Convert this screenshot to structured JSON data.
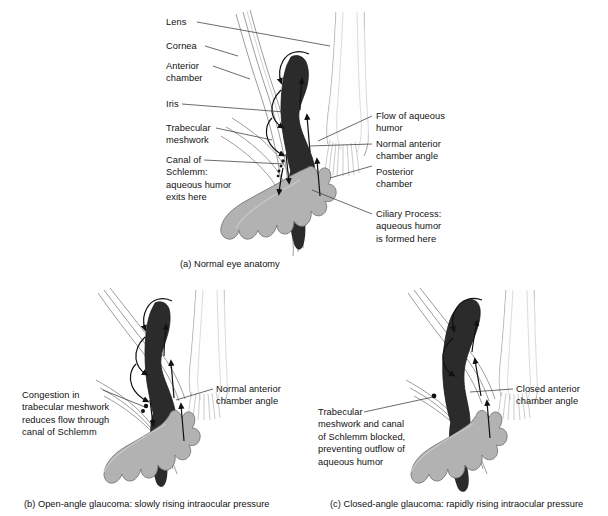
{
  "figure": {
    "background_color": "#ffffff",
    "colors": {
      "iris_dark": "#2b2b2b",
      "ciliary_gray": "#b2b2b2",
      "outline_gray": "#8d8d8d",
      "leader_line": "#3a3a3a",
      "text": "#111111"
    }
  },
  "panels": [
    {
      "id": "a",
      "caption": "(a) Normal eye anatomy",
      "labels_left": [
        {
          "name": "lens",
          "text": "Lens"
        },
        {
          "name": "cornea",
          "text": "Cornea"
        },
        {
          "name": "anterior-chamber",
          "text": "Anterior\nchamber"
        },
        {
          "name": "iris",
          "text": "Iris"
        },
        {
          "name": "trabecular-meshwork",
          "text": "Trabecular\nmeshwork"
        },
        {
          "name": "canal-of-schlemm",
          "text": "Canal of\nSchlemm:\naqueous humor\nexits here"
        }
      ],
      "labels_right": [
        {
          "name": "flow-of-aqueous-humor",
          "text": "Flow of aqueous\nhumor"
        },
        {
          "name": "normal-anterior-chamber-angle",
          "text": "Normal anterior\nchamber angle"
        },
        {
          "name": "posterior-chamber",
          "text": "Posterior\nchamber"
        },
        {
          "name": "ciliary-process",
          "text": "Ciliary Process:\naqueous humor\nis formed here"
        }
      ]
    },
    {
      "id": "b",
      "caption": "(b) Open-angle glaucoma: slowly rising intraocular pressure",
      "labels_left": [
        {
          "name": "congestion-trabecular-meshwork",
          "text": "Congestion in\ntrabecular meshwork\nreduces flow through\ncanal of Schlemm"
        }
      ],
      "labels_right": [
        {
          "name": "normal-anterior-chamber-angle",
          "text": "Normal anterior\nchamber angle"
        }
      ]
    },
    {
      "id": "c",
      "caption": "(c) Closed-angle glaucoma: rapidly rising intraocular pressure",
      "labels_left": [
        {
          "name": "trabecular-meshwork-blocked",
          "text": "Trabecular\nmeshwork and canal\nof Schlemm blocked,\npreventing outflow of\naqueous humor"
        }
      ],
      "labels_right": [
        {
          "name": "closed-anterior-chamber-angle",
          "text": "Closed anterior\nchamber angle"
        }
      ]
    }
  ]
}
